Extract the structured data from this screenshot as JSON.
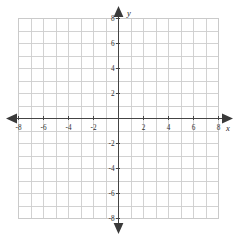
{
  "figure": {
    "kind": "cartesian-coordinate-grid",
    "background_color": "#ffffff",
    "grid_color": "#cdcdcd",
    "axis_color": "#444444",
    "label_color": "#2e2e2e"
  },
  "axes": {
    "x": {
      "name": "x",
      "min": -8,
      "max": 8,
      "step": 1,
      "label_step": 2,
      "arrows": [
        "left",
        "right"
      ],
      "labels": [
        "-8",
        "-6",
        "-4",
        "-2",
        "2",
        "4",
        "6",
        "8"
      ],
      "label_values": [
        -8,
        -6,
        -4,
        -2,
        2,
        4,
        6,
        8
      ]
    },
    "y": {
      "name": "y",
      "min": -8,
      "max": 8,
      "step": 1,
      "label_step": 2,
      "arrows": [
        "up",
        "down"
      ],
      "labels": [
        "8",
        "6",
        "4",
        "2",
        "-2",
        "-4",
        "-6",
        "-8"
      ],
      "label_values": [
        8,
        6,
        4,
        2,
        -2,
        -4,
        -6,
        -8
      ]
    }
  },
  "chart_data": {
    "type": "scatter",
    "title": "",
    "xlabel": "x",
    "ylabel": "y",
    "xlim": [
      -8,
      8
    ],
    "ylim": [
      -8,
      8
    ],
    "xticks": [
      -8,
      -6,
      -4,
      -2,
      2,
      4,
      6,
      8
    ],
    "yticks": [
      -8,
      -6,
      -4,
      -2,
      2,
      4,
      6,
      8
    ],
    "xticklabels": [
      "-8",
      "-6",
      "-4",
      "-2",
      "2",
      "4",
      "6",
      "8"
    ],
    "yticklabels": [
      "-8",
      "-6",
      "-4",
      "-2",
      "2",
      "4",
      "6",
      "8"
    ],
    "grid": true,
    "grid_spacing": 1,
    "legend": null,
    "series": [],
    "annotations": [],
    "origin_label": ""
  }
}
